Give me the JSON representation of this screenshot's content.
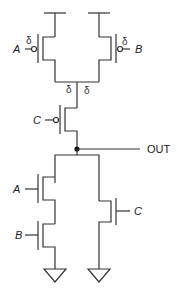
{
  "diagram": {
    "type": "CMOS logic gate schematic",
    "line_color": "#333333",
    "labels": {
      "input_a_top": "A",
      "input_b_top": "B",
      "input_c_mid": "C",
      "output": "OUT",
      "input_a_bottom": "A",
      "input_b_bottom": "B",
      "input_c_bottom": "C"
    },
    "annotations": [
      "δ",
      "δ",
      "δ",
      "δ"
    ],
    "transistors": [
      {
        "id": "pmos-a",
        "type": "PMOS",
        "gate": "A"
      },
      {
        "id": "pmos-b",
        "type": "PMOS",
        "gate": "B"
      },
      {
        "id": "pmos-c",
        "type": "PMOS",
        "gate": "C"
      },
      {
        "id": "nmos-a",
        "type": "NMOS",
        "gate": "A"
      },
      {
        "id": "nmos-b",
        "type": "NMOS",
        "gate": "B"
      },
      {
        "id": "nmos-c",
        "type": "NMOS",
        "gate": "C"
      }
    ]
  }
}
